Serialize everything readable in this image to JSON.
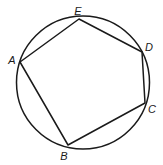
{
  "figure": {
    "circle": {
      "cx": 83,
      "cy": 82.5,
      "r": 66.5
    },
    "stroke_color": "#1a1a1a",
    "vertices": [
      {
        "name": "A",
        "x": 20,
        "y": 62,
        "label_x": 12,
        "label_y": 60
      },
      {
        "name": "B",
        "x": 68,
        "y": 145,
        "label_x": 64,
        "label_y": 156
      },
      {
        "name": "C",
        "x": 145,
        "y": 103,
        "label_x": 152,
        "label_y": 109
      },
      {
        "name": "D",
        "x": 142,
        "y": 52,
        "label_x": 149,
        "label_y": 47
      },
      {
        "name": "E",
        "x": 79,
        "y": 19,
        "label_x": 78,
        "label_y": 11
      }
    ],
    "polygon_order": [
      "A",
      "B",
      "C",
      "D",
      "E"
    ]
  },
  "labels": {
    "A": "A",
    "B": "B",
    "C": "C",
    "D": "D",
    "E": "E"
  }
}
